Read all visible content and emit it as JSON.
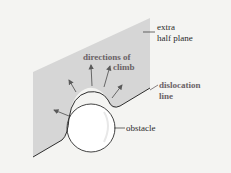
{
  "labels": {
    "extra_half_plane_line1": "extra",
    "extra_half_plane_line2": "half plane",
    "directions_of_climb_line1": "directions of",
    "directions_of_climb_line2": "climb",
    "dislocation_line_line1": "dislocation",
    "dislocation_line_line2": "line",
    "obstacle": "obstacle"
  },
  "colors": {
    "plane": "#d6d6d6",
    "line": "#2e2e2e",
    "arrow": "#5a5a5a",
    "obstacle_fill": "#ffffff",
    "background": "#f4f4f2",
    "emphasis_text": "#6a6266"
  }
}
